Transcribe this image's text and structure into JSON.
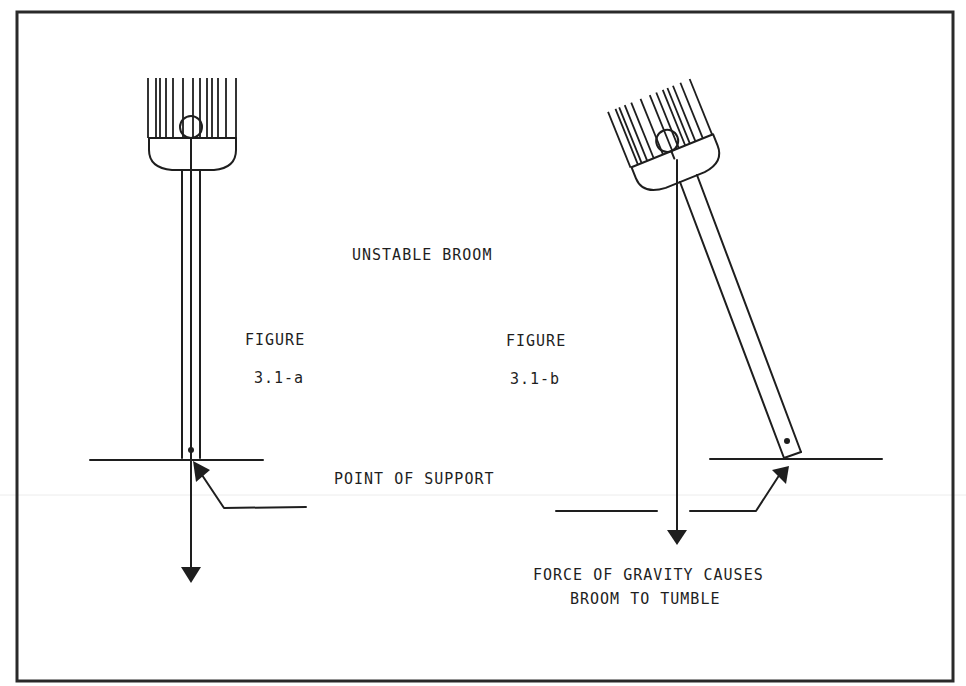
{
  "diagram": {
    "title": "UNSTABLE BROOM",
    "labels": {
      "figure_a_line1": "FIGURE",
      "figure_a_line2": "3.1-a",
      "figure_b_line1": "FIGURE",
      "figure_b_line2": "3.1-b",
      "support": "POINT OF SUPPORT",
      "gravity_line1": "FORCE OF GRAVITY CAUSES",
      "gravity_line2": "BROOM TO TUMBLE"
    },
    "frame": {
      "x": 17,
      "y": 12,
      "width": 936,
      "height": 669
    },
    "colors": {
      "ink": "#1e1e1e",
      "background": "#ffffff"
    },
    "broom_a": {
      "orientation": "vertical",
      "bristle_x": [
        148,
        156,
        160,
        166,
        173,
        183,
        193,
        200,
        207,
        212,
        218,
        226,
        236
      ],
      "bristle_top": 78,
      "bristle_bottom": 138
    },
    "broom_b": {
      "orientation": "tilted",
      "tilt_degrees": -22
    }
  }
}
